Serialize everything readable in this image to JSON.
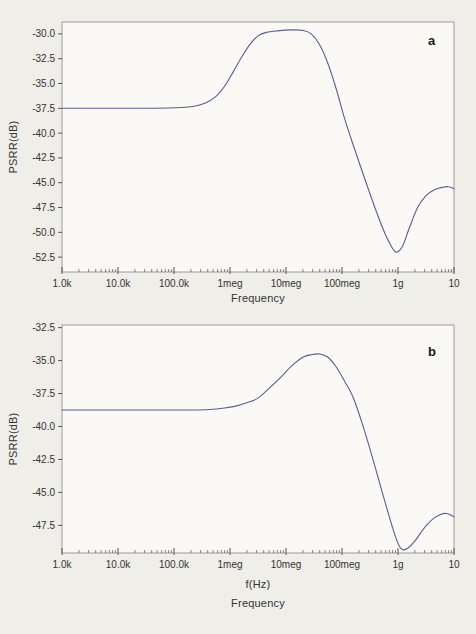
{
  "page": {
    "background": "#f0eee8"
  },
  "colors": {
    "plot_bg": "#faf9f6",
    "border": "#9a9a9a",
    "tick": "#555555",
    "text": "#333333"
  },
  "chart_data": [
    {
      "type": "line",
      "panel": "a",
      "corner_label": "a",
      "ylabel": "PSRR(dB)",
      "xlabel": "Frequency",
      "x_scale": "log10",
      "x_range_log10": [
        3,
        10
      ],
      "x_tick_log10": [
        3,
        4,
        5,
        6,
        7,
        8,
        9,
        10
      ],
      "x_tick_labels": [
        "1.0k",
        "10.0k",
        "100.0k",
        "1meg",
        "10meg",
        "100meg",
        "1g",
        "10"
      ],
      "y_tick_values": [
        -30.0,
        -32.5,
        -35.0,
        -37.5,
        -40.0,
        -42.5,
        -45.0,
        -47.5,
        -50.0,
        -52.5
      ],
      "y_tick_labels": [
        "-30.0",
        "-32.5",
        "-35.0",
        "-37.5",
        "-40.0",
        "-42.5",
        "-45.0",
        "-47.5",
        "-50.0",
        "-52.5"
      ],
      "ylim": [
        -54.0,
        -28.8
      ],
      "grid": false,
      "legend": null,
      "line_color": "#5c5c94",
      "points": [
        [
          3.0,
          -37.5
        ],
        [
          3.7,
          -37.5
        ],
        [
          4.4,
          -37.5
        ],
        [
          5.0,
          -37.45
        ],
        [
          5.3,
          -37.35
        ],
        [
          5.55,
          -37.0
        ],
        [
          5.75,
          -36.3
        ],
        [
          5.9,
          -35.3
        ],
        [
          6.05,
          -33.9
        ],
        [
          6.2,
          -32.4
        ],
        [
          6.35,
          -31.1
        ],
        [
          6.5,
          -30.2
        ],
        [
          6.65,
          -29.85
        ],
        [
          6.85,
          -29.7
        ],
        [
          7.1,
          -29.6
        ],
        [
          7.3,
          -29.65
        ],
        [
          7.45,
          -30.0
        ],
        [
          7.6,
          -31.1
        ],
        [
          7.75,
          -33.0
        ],
        [
          7.9,
          -35.6
        ],
        [
          8.05,
          -38.6
        ],
        [
          8.2,
          -41.2
        ],
        [
          8.4,
          -44.5
        ],
        [
          8.6,
          -47.7
        ],
        [
          8.75,
          -49.9
        ],
        [
          8.88,
          -51.4
        ],
        [
          8.97,
          -52.0
        ],
        [
          9.08,
          -51.4
        ],
        [
          9.2,
          -49.6
        ],
        [
          9.35,
          -47.5
        ],
        [
          9.5,
          -46.3
        ],
        [
          9.65,
          -45.7
        ],
        [
          9.8,
          -45.45
        ],
        [
          9.9,
          -45.4
        ],
        [
          10.0,
          -45.6
        ]
      ]
    },
    {
      "type": "line",
      "panel": "b",
      "corner_label": "b",
      "ylabel": "PSRR(dB)",
      "xlabel": "f(Hz)",
      "xlabel2": "Frequency",
      "x_scale": "log10",
      "x_range_log10": [
        3,
        10
      ],
      "x_tick_log10": [
        3,
        4,
        5,
        6,
        7,
        8,
        9,
        10
      ],
      "x_tick_labels": [
        "1.0k",
        "10.0k",
        "100.0k",
        "1meg",
        "10meg",
        "100meg",
        "1g",
        "10"
      ],
      "y_tick_values": [
        -32.5,
        -35.0,
        -37.5,
        -40.0,
        -42.5,
        -45.0,
        -47.5
      ],
      "y_tick_labels": [
        "-32.5",
        "-35.0",
        "-37.5",
        "-40.0",
        "-42.5",
        "-45.0",
        "-47.5"
      ],
      "ylim": [
        -49.6,
        -32.3
      ],
      "grid": false,
      "legend": null,
      "line_color": "#5c5c94",
      "points": [
        [
          3.0,
          -38.75
        ],
        [
          3.7,
          -38.75
        ],
        [
          4.4,
          -38.75
        ],
        [
          5.0,
          -38.75
        ],
        [
          5.4,
          -38.75
        ],
        [
          5.7,
          -38.7
        ],
        [
          5.9,
          -38.6
        ],
        [
          6.1,
          -38.45
        ],
        [
          6.3,
          -38.2
        ],
        [
          6.5,
          -37.85
        ],
        [
          6.7,
          -37.1
        ],
        [
          6.9,
          -36.3
        ],
        [
          7.1,
          -35.4
        ],
        [
          7.3,
          -34.75
        ],
        [
          7.45,
          -34.55
        ],
        [
          7.6,
          -34.5
        ],
        [
          7.75,
          -34.75
        ],
        [
          7.9,
          -35.5
        ],
        [
          8.05,
          -36.6
        ],
        [
          8.2,
          -37.8
        ],
        [
          8.4,
          -40.3
        ],
        [
          8.6,
          -43.2
        ],
        [
          8.8,
          -46.2
        ],
        [
          8.95,
          -48.3
        ],
        [
          9.05,
          -49.25
        ],
        [
          9.15,
          -49.3
        ],
        [
          9.3,
          -48.7
        ],
        [
          9.45,
          -47.8
        ],
        [
          9.6,
          -47.1
        ],
        [
          9.75,
          -46.7
        ],
        [
          9.87,
          -46.6
        ],
        [
          10.0,
          -46.85
        ]
      ]
    }
  ]
}
